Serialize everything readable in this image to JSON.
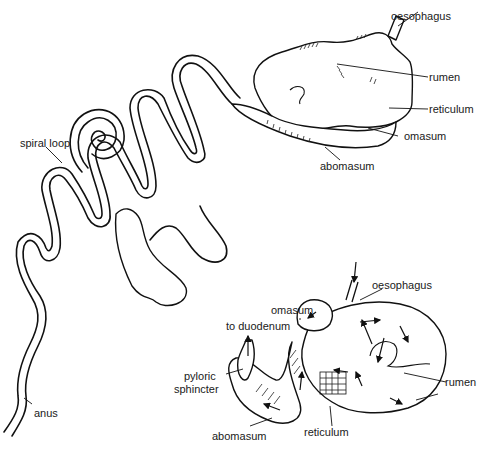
{
  "figure": {
    "upper_diagram": {
      "subject": "intestinal tract and stomach (external view)",
      "labels": {
        "oesophagus": "oesophagus",
        "rumen": "rumen",
        "reticulum": "reticulum",
        "omasum": "omasum",
        "abomasum": "abomasum",
        "spiral_loop": "spiral loop",
        "anus": "anus"
      }
    },
    "lower_diagram": {
      "subject": "stomach compartments (sectioned view with flow arrows)",
      "labels": {
        "oesophagus": "oesophagus",
        "omasum": "omasum",
        "to_duodenum": "to duodenum",
        "pyloric_sphincter_line1": "pyloric",
        "pyloric_sphincter_line2": "sphincter",
        "rumen": "rumen",
        "abomasum": "abomasum",
        "reticulum": "reticulum"
      }
    }
  }
}
